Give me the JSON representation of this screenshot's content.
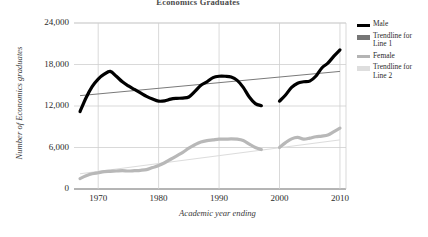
{
  "chart_data": {
    "type": "line",
    "title": "Economics Graduates",
    "xlabel": "Academic year ending",
    "ylabel": "Number of Economics graduates",
    "xlim": [
      1966,
      2011
    ],
    "ylim": [
      0,
      24000
    ],
    "xticks": [
      "1970",
      "1980",
      "1990",
      "2000",
      "2010"
    ],
    "xtick_values": [
      1970,
      1980,
      1990,
      2000,
      2010
    ],
    "yticks": [
      "0",
      "6,000",
      "12,000",
      "18,000",
      "24,000"
    ],
    "ytick_values": [
      0,
      6000,
      12000,
      18000,
      24000
    ],
    "grid": true,
    "legend_position": "right",
    "series": [
      {
        "name": "Male",
        "color": "#000000",
        "style": "thick-line",
        "x": [
          1967,
          1968,
          1969,
          1970,
          1971,
          1972,
          1973,
          1974,
          1975,
          1976,
          1977,
          1978,
          1979,
          1980,
          1981,
          1982,
          1983,
          1984,
          1985,
          1986,
          1987,
          1988,
          1989,
          1990,
          1991,
          1992,
          1993,
          1994,
          1995,
          1996,
          1997
        ],
        "values": [
          11200,
          13200,
          14800,
          15900,
          16600,
          17000,
          16300,
          15500,
          14900,
          14400,
          13900,
          13400,
          13000,
          12700,
          12750,
          13000,
          13100,
          13150,
          13300,
          14100,
          15000,
          15500,
          16100,
          16300,
          16300,
          16200,
          15700,
          14700,
          13300,
          12350,
          12050
        ]
      },
      {
        "name": "Male",
        "color": "#000000",
        "style": "thick-line",
        "segment": 2,
        "x": [
          2000,
          2001,
          2002,
          2003,
          2004,
          2005,
          2006,
          2007,
          2008,
          2009,
          2010
        ],
        "values": [
          12700,
          13600,
          14700,
          15300,
          15500,
          15600,
          16300,
          17500,
          18200,
          19200,
          20100
        ]
      },
      {
        "name": "Trendline for Line 1",
        "color": "#7a7a7a",
        "style": "thin-line",
        "x": [
          1967,
          2010
        ],
        "values": [
          13500,
          17000
        ]
      },
      {
        "name": "Female",
        "color": "#b8b8b8",
        "style": "thick-line",
        "x": [
          1967,
          1968,
          1969,
          1970,
          1971,
          1972,
          1973,
          1974,
          1975,
          1976,
          1977,
          1978,
          1979,
          1980,
          1981,
          1982,
          1983,
          1984,
          1985,
          1986,
          1987,
          1988,
          1989,
          1990,
          1991,
          1992,
          1993,
          1994,
          1995,
          1996,
          1997
        ],
        "values": [
          1500,
          1900,
          2200,
          2350,
          2500,
          2550,
          2600,
          2650,
          2600,
          2650,
          2700,
          2800,
          3100,
          3400,
          3800,
          4300,
          4800,
          5300,
          5900,
          6400,
          6800,
          7000,
          7100,
          7200,
          7200,
          7250,
          7200,
          7000,
          6500,
          6000,
          5700
        ]
      },
      {
        "name": "Female",
        "color": "#b8b8b8",
        "style": "thick-line",
        "segment": 2,
        "x": [
          2000,
          2001,
          2002,
          2003,
          2004,
          2005,
          2006,
          2007,
          2008,
          2009,
          2010
        ],
        "values": [
          6000,
          6700,
          7250,
          7450,
          7200,
          7350,
          7550,
          7650,
          7800,
          8300,
          8800
        ]
      },
      {
        "name": "Trendline for Line 2",
        "color": "#dcdcdc",
        "style": "thin-line",
        "x": [
          1967,
          2010
        ],
        "values": [
          2200,
          7100
        ]
      }
    ]
  },
  "legend": {
    "items": [
      {
        "label": "Male",
        "color": "#000000"
      },
      {
        "label": "Trendline for\nLine 1",
        "color": "#767676"
      },
      {
        "label": "Female",
        "color": "#b4b4b4"
      },
      {
        "label": "Trendline for\nLine 2",
        "color": "#dedede"
      }
    ]
  }
}
